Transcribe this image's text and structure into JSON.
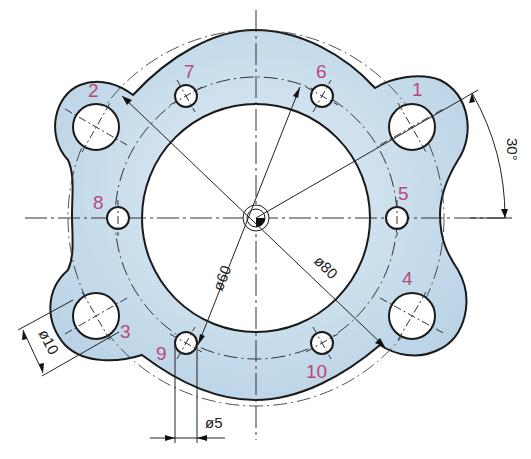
{
  "diagram": {
    "type": "technical-drawing",
    "colors": {
      "fill": "#c2d9ea",
      "fill_light": "#e3eef6",
      "outline": "#1a1a1a",
      "hole_labels": "#b8487a",
      "dim_lines": "#222222"
    },
    "hole_labels": {
      "h1": "1",
      "h2": "2",
      "h3": "3",
      "h4": "4",
      "h5": "5",
      "h6": "6",
      "h7": "7",
      "h8": "8",
      "h9": "9",
      "h10": "10"
    },
    "dimensions": {
      "inner_diameter": "ø60",
      "pitch_circle_diameter": "ø80",
      "large_hole_diameter": "ø10",
      "small_hole_diameter": "ø5",
      "angle": "30°"
    },
    "holes": {
      "large": {
        "count": 4,
        "ids": [
          "1",
          "2",
          "3",
          "4"
        ],
        "diameter": "ø10",
        "angles_deg": [
          30,
          150,
          210,
          330
        ]
      },
      "small": {
        "count": 6,
        "ids": [
          "5",
          "6",
          "7",
          "8",
          "9",
          "10"
        ],
        "diameter": "ø5",
        "angles_deg": [
          0,
          60,
          120,
          180,
          240,
          300
        ]
      }
    }
  }
}
